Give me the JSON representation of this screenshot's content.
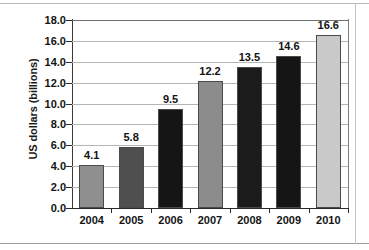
{
  "chart_data": {
    "type": "bar",
    "title": "",
    "subtitle": "",
    "xlabel": "",
    "ylabel": "US dollars (billions)",
    "categories": [
      "2004",
      "2005",
      "2006",
      "2007",
      "2008",
      "2009",
      "2010"
    ],
    "values": [
      4.1,
      5.8,
      9.5,
      12.2,
      13.5,
      14.6,
      16.6
    ],
    "data_labels": [
      "4.1",
      "5.8",
      "9.5",
      "12.2",
      "13.5",
      "14.6",
      "16.6"
    ],
    "ylim": [
      0.0,
      18.0
    ],
    "ytick_step": 2.0,
    "ytick_labels": [
      "18.0",
      "16.0",
      "14.0",
      "12.0",
      "10.0",
      "8.0",
      "6.0",
      "4.0",
      "2.0",
      "0.0"
    ],
    "ytick_values": [
      18.0,
      16.0,
      14.0,
      12.0,
      10.0,
      8.0,
      6.0,
      4.0,
      2.0,
      0.0
    ],
    "grid": "horizontal",
    "legend": "none",
    "bar_colors": [
      "#8f8f8f",
      "#4f4f4f",
      "#151515",
      "#8c8c8c",
      "#1b1b1b",
      "#151515",
      "#c9c9c9"
    ],
    "bar_border_color": "#4a4a4a",
    "gridline_color": "#b5b5b5",
    "axis_color": "#2b2b2b",
    "label_color": "#141414",
    "background": "#ffffff"
  }
}
